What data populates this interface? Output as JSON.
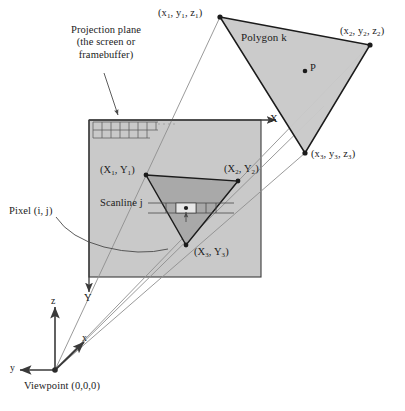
{
  "figure": {
    "type": "technical-diagram",
    "width": 405,
    "height": 411,
    "background_color": "#ffffff"
  },
  "colors": {
    "polygon_fill": "#c9c9c9",
    "polygon_stroke": "#1b1b1b",
    "screen_fill": "#c9c9c9",
    "screen_stroke": "#3b3b3b",
    "projected_triangle_fill": "#a8a8a8",
    "projected_triangle_stroke": "#1b1b1b",
    "projector_ray": "#8c8c8c",
    "grid_line": "#5c5c5c",
    "axis": "#3a3a3a",
    "text": "#1b1b1b",
    "leader_line": "#4a4a4a"
  },
  "labels": {
    "projection_plane": {
      "line1": "Projection plane",
      "line2": "(the screen or",
      "line3": "framebuffer)"
    },
    "polygon_name": "Polygon k",
    "point_p": "P",
    "scanline": "Scanline j",
    "pixel": "Pixel (i, j)",
    "viewpoint": "Viewpoint (0,0,0)"
  },
  "world_vertices": [
    {
      "id": "v1",
      "label_parts": [
        "(x",
        "1",
        ", y",
        "1",
        ", z",
        "1",
        ")"
      ],
      "label_plain": "(x1, y1, z1)",
      "x": 220,
      "y": 17
    },
    {
      "id": "v2",
      "label_parts": [
        "(x",
        "2",
        ", y",
        "2",
        ", z",
        "2",
        ")"
      ],
      "label_plain": "(x2, y2, z2)",
      "x": 370,
      "y": 45
    },
    {
      "id": "v3",
      "label_parts": [
        "(x",
        "3",
        ", y",
        "3",
        ", z",
        "3",
        ")"
      ],
      "label_plain": "(x3, y3, z3)",
      "x": 305,
      "y": 153
    }
  ],
  "screen_vertices": [
    {
      "id": "V1",
      "label_plain": "(X1, Y1)",
      "x": 146,
      "y": 175
    },
    {
      "id": "V2",
      "label_plain": "(X2, Y2)",
      "x": 238,
      "y": 181
    },
    {
      "id": "V3",
      "label_plain": "(X3, Y3)",
      "x": 186,
      "y": 245
    }
  ],
  "axes": {
    "screen_x": "X",
    "screen_y": "Y",
    "world_x": "x",
    "world_y": "y",
    "world_z": "z"
  },
  "geometry": {
    "screen_rect": {
      "x": 89,
      "y": 120,
      "w": 172,
      "h": 157
    },
    "viewpoint": {
      "x": 55,
      "y": 370
    },
    "interior_point_p": {
      "x": 305,
      "y": 71
    },
    "pixel_marker": {
      "x": 186,
      "y": 208
    },
    "grid_rows": 2,
    "grid_cols": 7
  }
}
